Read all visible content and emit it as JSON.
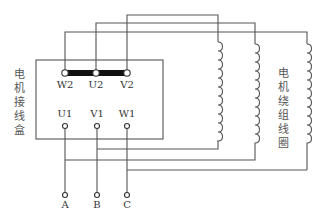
{
  "diagram": {
    "box_label": "电机接线盒",
    "winding_label": "电机绕组线圈",
    "terminals_top": [
      {
        "label": "W2",
        "x": 65
      },
      {
        "label": "U2",
        "x": 96
      },
      {
        "label": "V2",
        "x": 127
      }
    ],
    "terminals_bottom": [
      {
        "label": "U1",
        "x": 65
      },
      {
        "label": "V1",
        "x": 97
      },
      {
        "label": "W1",
        "x": 127
      }
    ],
    "supply_terminals": [
      {
        "label": "A",
        "x": 65
      },
      {
        "label": "B",
        "x": 97
      },
      {
        "label": "C",
        "x": 127
      }
    ],
    "colors": {
      "line": "#555555",
      "bar": "#111111",
      "text": "#333333"
    }
  }
}
